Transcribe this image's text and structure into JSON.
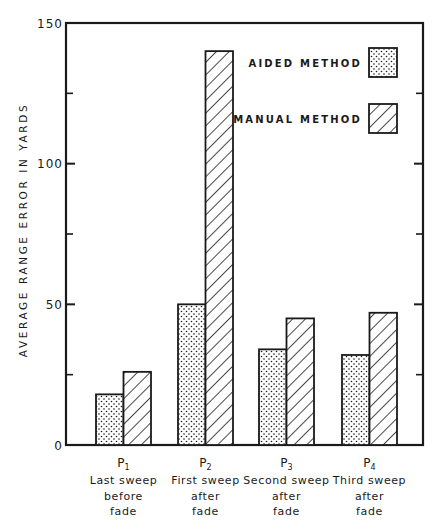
{
  "chart_data": {
    "type": "bar",
    "title": "",
    "xlabel": "",
    "ylabel": "AVERAGE RANGE ERROR IN YARDS",
    "ylim": [
      0,
      150
    ],
    "yticks": [
      0,
      50,
      100,
      150
    ],
    "minor_yticks": [
      25,
      75,
      125
    ],
    "grid": false,
    "legend_position": "upper right (inside)",
    "categories": [
      {
        "code": "P",
        "sub": "1",
        "lines": [
          "Last sweep",
          "before",
          "fade"
        ]
      },
      {
        "code": "P",
        "sub": "2",
        "lines": [
          "First sweep",
          "after",
          "fade"
        ]
      },
      {
        "code": "P",
        "sub": "3",
        "lines": [
          "Second sweep",
          "after",
          "fade"
        ]
      },
      {
        "code": "P",
        "sub": "4",
        "lines": [
          "Third sweep",
          "after",
          "fade"
        ]
      }
    ],
    "series": [
      {
        "name": "AIDED METHOD",
        "pattern": "dots",
        "values": [
          18,
          50,
          34,
          32
        ]
      },
      {
        "name": "MANUAL METHOD",
        "pattern": "hatch",
        "values": [
          26,
          140,
          45,
          47
        ]
      }
    ]
  },
  "colors": {
    "ink": "#1a1a1a",
    "background": "#ffffff"
  }
}
